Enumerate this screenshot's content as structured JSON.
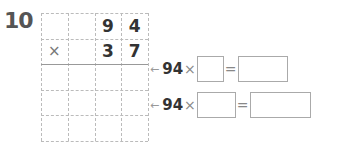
{
  "problem_number": "10",
  "grid": {
    "rows": [
      [
        "",
        "",
        "9",
        "4"
      ],
      [
        "×",
        "",
        "3",
        "7"
      ],
      [
        "",
        "",
        "",
        ""
      ],
      [
        "",
        "",
        "",
        ""
      ],
      [
        "",
        "",
        "",
        ""
      ]
    ]
  },
  "equations": [
    {
      "arrow": "←",
      "multiplicand": "94",
      "times": "×",
      "equals": "=",
      "factor_value": "",
      "result_value": ""
    },
    {
      "arrow": "←",
      "multiplicand": "94",
      "times": "×",
      "equals": "=",
      "factor_value": "",
      "result_value": ""
    }
  ]
}
